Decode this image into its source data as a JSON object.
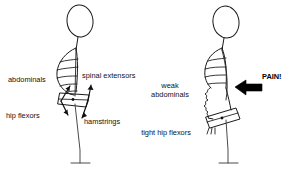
{
  "figure": {
    "background_color": "#ffffff",
    "line_color": "#1a1a1a",
    "width": 293,
    "height": 177
  },
  "left_figure": {
    "name": "neutral-posture-figure",
    "description": "Stick figure with balanced pelvis and four labelled muscle force arrows",
    "labels": [
      {
        "id": "abdominals",
        "text": "abdominals",
        "x": 8,
        "y": 82,
        "anchor": "start"
      },
      {
        "id": "spinal-extensors",
        "text": "spinal extensors",
        "x": 82,
        "y": 78,
        "anchor": "start"
      },
      {
        "id": "hip-flexors",
        "text": "hip flexors",
        "x": 6,
        "y": 118,
        "anchor": "start"
      },
      {
        "id": "hamstrings",
        "text": "hamstrings",
        "x": 84,
        "y": 124,
        "anchor": "start"
      }
    ],
    "arrows": [
      {
        "id": "abdominals-arrow",
        "direction": "up-right"
      },
      {
        "id": "spinal-extensors-arrow",
        "direction": "up"
      },
      {
        "id": "hip-flexors-arrow",
        "direction": "down-left"
      },
      {
        "id": "hamstrings-arrow",
        "direction": "down-right"
      }
    ]
  },
  "right_figure": {
    "name": "anterior-pelvic-tilt-figure",
    "description": "Stick figure with tilted pelvis, slack abdominal wall and low-back pain marker",
    "labels": [
      {
        "id": "weak-abdominals-line1",
        "text": "weak",
        "x": 170,
        "y": 88,
        "anchor": "middle"
      },
      {
        "id": "weak-abdominals-line2",
        "text": "abdominals",
        "x": 170,
        "y": 97,
        "anchor": "middle"
      },
      {
        "id": "tight-hip-flexors",
        "text": "tight hip flexors",
        "x": 166,
        "y": 135,
        "anchor": "middle"
      },
      {
        "id": "pain",
        "text": "PAIN!",
        "x": 262,
        "y": 79,
        "anchor": "start"
      }
    ],
    "pain_arrow": {
      "id": "pain-arrow",
      "direction": "left",
      "color": "#000000"
    }
  }
}
